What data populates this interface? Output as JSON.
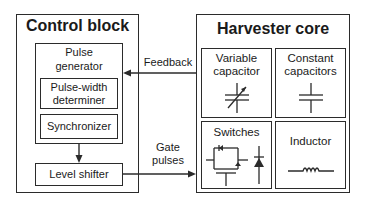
{
  "control_block": {
    "title": "Control block",
    "pulse_generator": {
      "label_line1": "Pulse",
      "label_line2": "generator",
      "pulse_width_determiner": {
        "line1": "Pulse-width",
        "line2": "determiner"
      },
      "synchronizer": "Synchronizer"
    },
    "level_shifter": "Level shifter"
  },
  "connections": {
    "feedback": "Feedback",
    "gate_line1": "Gate",
    "gate_line2": "pulses"
  },
  "harvester_core": {
    "title": "Harvester core",
    "cells": [
      {
        "line1": "Variable",
        "line2": "capacitor",
        "icon": "variable-capacitor-icon"
      },
      {
        "line1": "Constant",
        "line2": "capacitors",
        "icon": "capacitor-icon"
      },
      {
        "line1": "Switches",
        "icon": "mosfet-switch-icon"
      },
      {
        "line1": "Inductor",
        "icon": "inductor-icon"
      }
    ]
  },
  "colors": {
    "line": "#2b2b2b",
    "background": "#ffffff"
  }
}
